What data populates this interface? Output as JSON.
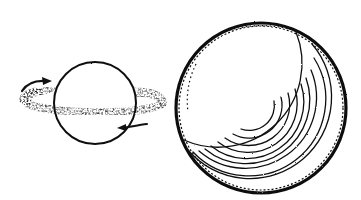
{
  "figure": {
    "colors": {
      "ink": "#111111",
      "background": "#ffffff"
    },
    "small_sphere": {
      "cx": 95,
      "cy": 103,
      "r": 41
    },
    "ring": {
      "cx": 93,
      "cy": 101,
      "rx": 71,
      "ry": 12,
      "rotation_deg": 3
    },
    "arrows": [
      {
        "name": "upper-left-arrow",
        "direction": "clockwise"
      },
      {
        "name": "lower-right-arrow",
        "direction": "left"
      }
    ],
    "large_sphere": {
      "cx": 261,
      "cy": 108,
      "r": 86,
      "shading_arcs": 10
    }
  }
}
